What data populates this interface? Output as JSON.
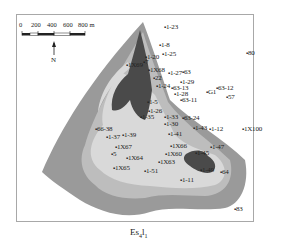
{
  "map": {
    "caption": "Es",
    "caption_sub1": "4",
    "caption_mid": "l",
    "caption_sub2": "1",
    "north_label": "N",
    "scale_bar": {
      "labels": [
        "0",
        "200",
        "400",
        "600",
        "800 m"
      ]
    },
    "colors": {
      "outer_zone": "#9a9a9a",
      "middle_zone": "#bdbdbd",
      "light_zone": "#d9d9d9",
      "dark_core": "#4a4a4a",
      "frame": "#a8a8a8"
    },
    "wells": [
      {
        "label": "1-23",
        "x": 166,
        "y": 28
      },
      {
        "label": "1-8",
        "x": 161,
        "y": 46
      },
      {
        "label": "1-20",
        "x": 147,
        "y": 58
      },
      {
        "label": "1-25",
        "x": 164,
        "y": 55
      },
      {
        "label": "80",
        "x": 248,
        "y": 54
      },
      {
        "label": "1X69",
        "x": 128,
        "y": 66
      },
      {
        "label": "7",
        "x": 145,
        "y": 63
      },
      {
        "label": "1X68",
        "x": 150,
        "y": 71
      },
      {
        "label": "1-27",
        "x": 170,
        "y": 74
      },
      {
        "label": "63",
        "x": 184,
        "y": 73
      },
      {
        "label": "22",
        "x": 155,
        "y": 79
      },
      {
        "label": "1-29",
        "x": 182,
        "y": 83
      },
      {
        "label": "1-24",
        "x": 158,
        "y": 87
      },
      {
        "label": "63-13",
        "x": 173,
        "y": 89
      },
      {
        "label": "1-28",
        "x": 176,
        "y": 95
      },
      {
        "label": "63-11",
        "x": 182,
        "y": 101
      },
      {
        "label": "G1",
        "x": 208,
        "y": 93
      },
      {
        "label": "63-12",
        "x": 218,
        "y": 89
      },
      {
        "label": "57",
        "x": 228,
        "y": 98
      },
      {
        "label": "1-5",
        "x": 149,
        "y": 103
      },
      {
        "label": "1-26",
        "x": 150,
        "y": 112
      },
      {
        "label": "1-33",
        "x": 166,
        "y": 118
      },
      {
        "label": "63-24",
        "x": 184,
        "y": 119
      },
      {
        "label": "1-30",
        "x": 166,
        "y": 125
      },
      {
        "label": "1-35",
        "x": 142,
        "y": 118
      },
      {
        "label": "1-43",
        "x": 195,
        "y": 129
      },
      {
        "label": "1-12",
        "x": 211,
        "y": 130
      },
      {
        "label": "1X100",
        "x": 244,
        "y": 130
      },
      {
        "label": "66-38",
        "x": 97,
        "y": 130
      },
      {
        "label": "1-37",
        "x": 108,
        "y": 138
      },
      {
        "label": "1-39",
        "x": 124,
        "y": 136
      },
      {
        "label": "1-41",
        "x": 170,
        "y": 135
      },
      {
        "label": "1X67",
        "x": 117,
        "y": 148
      },
      {
        "label": "1X66",
        "x": 172,
        "y": 147
      },
      {
        "label": "5",
        "x": 113,
        "y": 155
      },
      {
        "label": "1X60",
        "x": 167,
        "y": 155
      },
      {
        "label": "1-47",
        "x": 212,
        "y": 148
      },
      {
        "label": "1-45",
        "x": 197,
        "y": 154
      },
      {
        "label": "1X64",
        "x": 128,
        "y": 159
      },
      {
        "label": "1X65",
        "x": 115,
        "y": 169
      },
      {
        "label": "1X63",
        "x": 160,
        "y": 163
      },
      {
        "label": "1-51",
        "x": 146,
        "y": 172
      },
      {
        "label": "1-49",
        "x": 202,
        "y": 171
      },
      {
        "label": "64",
        "x": 222,
        "y": 173
      },
      {
        "label": "1-11",
        "x": 182,
        "y": 181
      },
      {
        "label": "83",
        "x": 236,
        "y": 210
      }
    ]
  }
}
